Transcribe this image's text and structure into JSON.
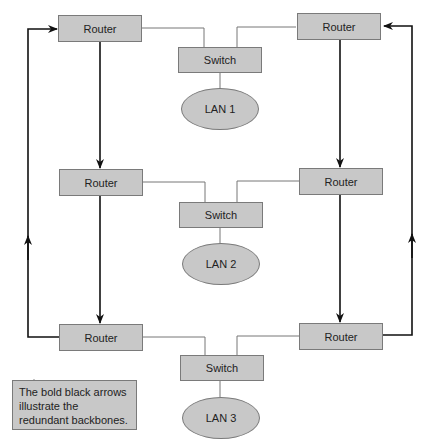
{
  "diagram": {
    "routers": [
      {
        "label": "Router",
        "position": "top-left"
      },
      {
        "label": "Router",
        "position": "top-right"
      },
      {
        "label": "Router",
        "position": "middle-left"
      },
      {
        "label": "Router",
        "position": "middle-right"
      },
      {
        "label": "Router",
        "position": "bottom-left"
      },
      {
        "label": "Router",
        "position": "bottom-right"
      }
    ],
    "switches": [
      {
        "label": "Switch"
      },
      {
        "label": "Switch"
      },
      {
        "label": "Switch"
      }
    ],
    "lans": [
      {
        "label": "LAN 1"
      },
      {
        "label": "LAN 2"
      },
      {
        "label": "LAN 3"
      }
    ],
    "note": {
      "text": "The bold black arrows illustrate the redundant backbones."
    },
    "colors": {
      "node_fill": "#c8c8c8",
      "node_border": "#7a7a7a",
      "thin_line": "#777777",
      "bold_line": "#111111"
    }
  }
}
